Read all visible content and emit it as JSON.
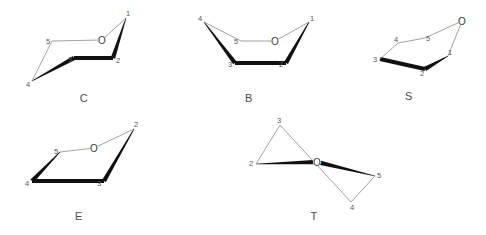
{
  "figure": {
    "width": 486,
    "height": 235,
    "background": "#ffffff",
    "line_color": "#8a8a8a",
    "wedge_color": "#101010",
    "label_color": "#555555",
    "caption_color": "#4a4a4a"
  },
  "conformers": [
    {
      "id": "C",
      "caption": "C",
      "caption_pos": {
        "x": 84,
        "y": 98
      },
      "atoms": [
        {
          "label": "1",
          "x": 128,
          "y": 13,
          "node_x": 126,
          "node_y": 18,
          "type": "carbon"
        },
        {
          "label": "2",
          "x": 118,
          "y": 60,
          "node_x": 113,
          "node_y": 58,
          "type": "carbon"
        },
        {
          "label": "3",
          "x": 70,
          "y": 59,
          "node_x": 74,
          "node_y": 58,
          "type": "carbon"
        },
        {
          "label": "4",
          "x": 28,
          "y": 84,
          "node_x": 32,
          "node_y": 81,
          "type": "carbon"
        },
        {
          "label": "5",
          "x": 48,
          "y": 41,
          "node_x": 52,
          "node_y": 41,
          "type": "carbon"
        },
        {
          "label": "O",
          "x": 102,
          "y": 40,
          "node_x": 102,
          "node_y": 40,
          "type": "oxygen"
        }
      ],
      "bonds": [
        {
          "from": "1",
          "to": "2",
          "style": "wedge",
          "wide_at": "to"
        },
        {
          "from": "2",
          "to": "3",
          "style": "bold"
        },
        {
          "from": "3",
          "to": "4",
          "style": "wedge",
          "wide_at": "from"
        },
        {
          "from": "4",
          "to": "5",
          "style": "thin"
        },
        {
          "from": "5",
          "to": "O",
          "style": "thin"
        },
        {
          "from": "O",
          "to": "1",
          "style": "thin"
        }
      ]
    },
    {
      "id": "B",
      "caption": "B",
      "caption_pos": {
        "x": 249,
        "y": 98
      },
      "atoms": [
        {
          "label": "1",
          "x": 312,
          "y": 18,
          "node_x": 309,
          "node_y": 22,
          "type": "carbon"
        },
        {
          "label": "2",
          "x": 281,
          "y": 64,
          "node_x": 286,
          "node_y": 63,
          "type": "carbon"
        },
        {
          "label": "3",
          "x": 230,
          "y": 64,
          "node_x": 235,
          "node_y": 63,
          "type": "carbon"
        },
        {
          "label": "4",
          "x": 200,
          "y": 18,
          "node_x": 204,
          "node_y": 22,
          "type": "carbon"
        },
        {
          "label": "5",
          "x": 236,
          "y": 41,
          "node_x": 241,
          "node_y": 41,
          "type": "carbon"
        },
        {
          "label": "O",
          "x": 275,
          "y": 41,
          "node_x": 275,
          "node_y": 41,
          "type": "oxygen"
        }
      ],
      "bonds": [
        {
          "from": "1",
          "to": "2",
          "style": "wedge",
          "wide_at": "to"
        },
        {
          "from": "2",
          "to": "3",
          "style": "bold"
        },
        {
          "from": "3",
          "to": "4",
          "style": "wedge",
          "wide_at": "from"
        },
        {
          "from": "4",
          "to": "5",
          "style": "thin"
        },
        {
          "from": "5",
          "to": "O",
          "style": "thin"
        },
        {
          "from": "O",
          "to": "1",
          "style": "thin"
        }
      ]
    },
    {
      "id": "S",
      "caption": "S",
      "caption_pos": {
        "x": 409,
        "y": 96
      },
      "atoms": [
        {
          "label": "1",
          "x": 450,
          "y": 52,
          "node_x": 448,
          "node_y": 56,
          "type": "carbon"
        },
        {
          "label": "2",
          "x": 422,
          "y": 73,
          "node_x": 425,
          "node_y": 69,
          "type": "carbon"
        },
        {
          "label": "3",
          "x": 375,
          "y": 59,
          "node_x": 380,
          "node_y": 59,
          "type": "carbon"
        },
        {
          "label": "4",
          "x": 396,
          "y": 39,
          "node_x": 398,
          "node_y": 43,
          "type": "carbon"
        },
        {
          "label": "5",
          "x": 428,
          "y": 38,
          "node_x": 425,
          "node_y": 38,
          "type": "carbon"
        },
        {
          "label": "O",
          "x": 462,
          "y": 21,
          "node_x": 462,
          "node_y": 21,
          "type": "oxygen"
        }
      ],
      "bonds": [
        {
          "from": "1",
          "to": "2",
          "style": "wedge",
          "wide_at": "to"
        },
        {
          "from": "2",
          "to": "3",
          "style": "bold"
        },
        {
          "from": "3",
          "to": "4",
          "style": "thin"
        },
        {
          "from": "4",
          "to": "5",
          "style": "thin"
        },
        {
          "from": "5",
          "to": "O",
          "style": "thin"
        },
        {
          "from": "O",
          "to": "1",
          "style": "thin"
        }
      ]
    },
    {
      "id": "E",
      "caption": "E",
      "caption_pos": {
        "x": 79,
        "y": 216
      },
      "atoms": [
        {
          "label": "2",
          "x": 136,
          "y": 124,
          "node_x": 134,
          "node_y": 129,
          "type": "carbon"
        },
        {
          "label": "3",
          "x": 99,
          "y": 183,
          "node_x": 104,
          "node_y": 181,
          "type": "carbon"
        },
        {
          "label": "4",
          "x": 27,
          "y": 183,
          "node_x": 32,
          "node_y": 181,
          "type": "carbon"
        },
        {
          "label": "5",
          "x": 56,
          "y": 151,
          "node_x": 60,
          "node_y": 152,
          "type": "carbon"
        },
        {
          "label": "O",
          "x": 94,
          "y": 148,
          "node_x": 94,
          "node_y": 148,
          "type": "oxygen"
        }
      ],
      "bonds": [
        {
          "from": "2",
          "to": "3",
          "style": "wedge",
          "wide_at": "to"
        },
        {
          "from": "3",
          "to": "4",
          "style": "bold"
        },
        {
          "from": "4",
          "to": "5",
          "style": "wedge",
          "wide_at": "from"
        },
        {
          "from": "5",
          "to": "O",
          "style": "thin"
        },
        {
          "from": "O",
          "to": "2",
          "style": "thin"
        }
      ]
    },
    {
      "id": "T",
      "caption": "T",
      "caption_pos": {
        "x": 314,
        "y": 216
      },
      "atoms": [
        {
          "label": "2",
          "x": 251,
          "y": 163,
          "node_x": 256,
          "node_y": 164,
          "type": "carbon"
        },
        {
          "label": "3",
          "x": 279,
          "y": 120,
          "node_x": 280,
          "node_y": 125,
          "type": "carbon"
        },
        {
          "label": "4",
          "x": 352,
          "y": 207,
          "node_x": 351,
          "node_y": 202,
          "type": "carbon"
        },
        {
          "label": "5",
          "x": 379,
          "y": 175,
          "node_x": 375,
          "node_y": 176,
          "type": "carbon"
        },
        {
          "label": "O",
          "x": 317,
          "y": 162,
          "node_x": 317,
          "node_y": 162,
          "type": "oxygen"
        }
      ],
      "bonds": [
        {
          "from": "2",
          "to": "O",
          "style": "wedge",
          "wide_at": "to"
        },
        {
          "from": "O",
          "to": "5",
          "style": "wedge",
          "wide_at": "from"
        },
        {
          "from": "2",
          "to": "3",
          "style": "thin"
        },
        {
          "from": "3",
          "to": "4",
          "style": "thin"
        },
        {
          "from": "4",
          "to": "5",
          "style": "thin"
        }
      ]
    }
  ]
}
